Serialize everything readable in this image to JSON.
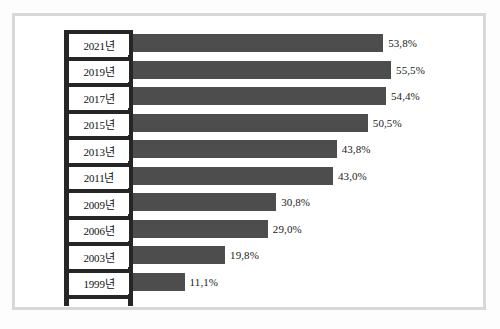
{
  "chart_data": {
    "type": "bar",
    "orientation": "horizontal",
    "title": "",
    "subtitle": "",
    "xlabel": "",
    "ylabel": "",
    "grid": false,
    "legend": null,
    "xlim": [
      0,
      60
    ],
    "value_suffix": "%",
    "decimal_separator": ",",
    "categories": [
      "2021년",
      "2019년",
      "2017년",
      "2015년",
      "2013년",
      "2011년",
      "2009년",
      "2006년",
      "2003년",
      "1999년"
    ],
    "values": [
      53.8,
      55.5,
      54.4,
      50.5,
      43.8,
      43.0,
      30.8,
      29.0,
      19.8,
      11.1
    ],
    "value_labels": [
      "53,8%",
      "55,5%",
      "54,4%",
      "50,5%",
      "43,8%",
      "43,0%",
      "30,8%",
      "29,0%",
      "19,8%",
      "11,1%"
    ],
    "bars": [
      {
        "category": "2021년",
        "value": 53.8,
        "label": "53,8%"
      },
      {
        "category": "2019년",
        "value": 55.5,
        "label": "55,5%"
      },
      {
        "category": "2017년",
        "value": 54.4,
        "label": "54,4%"
      },
      {
        "category": "2015년",
        "value": 50.5,
        "label": "50,5%"
      },
      {
        "category": "2013년",
        "value": 43.8,
        "label": "43,8%"
      },
      {
        "category": "2011년",
        "value": 43.0,
        "label": "43,0%"
      },
      {
        "category": "2009년",
        "value": 30.8,
        "label": "30,8%"
      },
      {
        "category": "2006년",
        "value": 29.0,
        "label": "29,0%"
      },
      {
        "category": "2003년",
        "value": 19.8,
        "label": "19,8%"
      },
      {
        "category": "1999년",
        "value": 11.1,
        "label": "11,1%"
      }
    ]
  },
  "style": {
    "bar_color": "#4d4d4d",
    "axis_color": "#262626",
    "frame_color": "#d8d8d8",
    "background": "#ffffff",
    "text_color": "#111111"
  }
}
